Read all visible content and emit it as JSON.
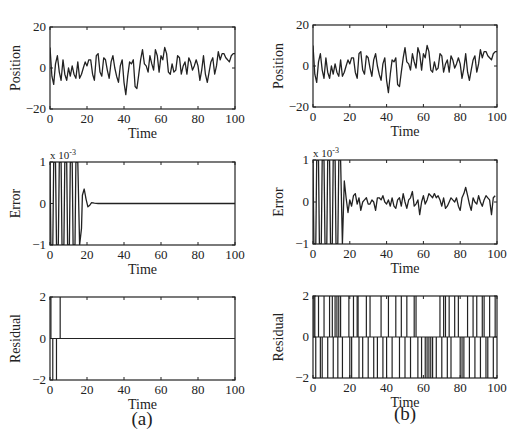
{
  "figure": {
    "captions": [
      "(a)",
      "(b)"
    ],
    "exponent_label": "x 10",
    "exponent_power": "-3"
  },
  "chart_data": [
    {
      "id": "a-position",
      "panel": "(a)",
      "type": "line",
      "title": "",
      "xlabel": "Time",
      "ylabel": "Position",
      "xlim": [
        0,
        100
      ],
      "ylim": [
        -20,
        20
      ],
      "xticks": [
        0,
        20,
        40,
        60,
        80,
        100
      ],
      "yticks": [
        -20,
        0,
        20
      ],
      "x": [
        0,
        1,
        2,
        3,
        4,
        5,
        6,
        7,
        8,
        9,
        10,
        11,
        12,
        13,
        14,
        15,
        16,
        17,
        18,
        19,
        20,
        21,
        22,
        23,
        24,
        25,
        26,
        27,
        28,
        29,
        30,
        31,
        32,
        33,
        34,
        35,
        36,
        37,
        38,
        39,
        40,
        41,
        42,
        43,
        44,
        45,
        46,
        47,
        48,
        49,
        50,
        51,
        52,
        53,
        54,
        55,
        56,
        57,
        58,
        59,
        60,
        61,
        62,
        63,
        64,
        65,
        66,
        67,
        68,
        69,
        70,
        71,
        72,
        73,
        74,
        75,
        76,
        77,
        78,
        79,
        80,
        81,
        82,
        83,
        84,
        85,
        86,
        87,
        88,
        89,
        90,
        91,
        92,
        93,
        94,
        95,
        96,
        97,
        98,
        99,
        100
      ],
      "values": [
        10,
        -4,
        -8,
        2,
        6,
        -2,
        -6,
        4,
        -3,
        -6,
        0,
        -4,
        1,
        -3,
        -5,
        3,
        -5,
        -3,
        0,
        3,
        1,
        4,
        4,
        -3,
        -6,
        6,
        7,
        -2,
        -4,
        5,
        4,
        -1,
        -5,
        3,
        6,
        0,
        -4,
        -7,
        1,
        4,
        -7,
        -13,
        -4,
        3,
        2,
        4,
        -9,
        -10,
        -3,
        4,
        9,
        2,
        1,
        -2,
        6,
        2,
        -1,
        9,
        6,
        -2,
        6,
        4,
        10,
        7,
        -2,
        -3,
        2,
        -2,
        -1,
        6,
        5,
        -3,
        1,
        3,
        -3,
        5,
        3,
        -1,
        1,
        4,
        1,
        -6,
        -1,
        6,
        -3,
        -7,
        -2,
        3,
        5,
        -3,
        1,
        8,
        4,
        7,
        7,
        5,
        4,
        3,
        6,
        7,
        7
      ]
    },
    {
      "id": "b-position",
      "panel": "(b)",
      "type": "line",
      "title": "",
      "xlabel": "Time",
      "ylabel": "Position",
      "xlim": [
        0,
        100
      ],
      "ylim": [
        -20,
        20
      ],
      "xticks": [
        0,
        20,
        40,
        60,
        80,
        100
      ],
      "yticks": [
        -20,
        0,
        20
      ],
      "x": [
        0,
        1,
        2,
        3,
        4,
        5,
        6,
        7,
        8,
        9,
        10,
        11,
        12,
        13,
        14,
        15,
        16,
        17,
        18,
        19,
        20,
        21,
        22,
        23,
        24,
        25,
        26,
        27,
        28,
        29,
        30,
        31,
        32,
        33,
        34,
        35,
        36,
        37,
        38,
        39,
        40,
        41,
        42,
        43,
        44,
        45,
        46,
        47,
        48,
        49,
        50,
        51,
        52,
        53,
        54,
        55,
        56,
        57,
        58,
        59,
        60,
        61,
        62,
        63,
        64,
        65,
        66,
        67,
        68,
        69,
        70,
        71,
        72,
        73,
        74,
        75,
        76,
        77,
        78,
        79,
        80,
        81,
        82,
        83,
        84,
        85,
        86,
        87,
        88,
        89,
        90,
        91,
        92,
        93,
        94,
        95,
        96,
        97,
        98,
        99,
        100
      ],
      "values": [
        10,
        -4,
        -8,
        2,
        6,
        -2,
        -6,
        4,
        -3,
        -6,
        0,
        -4,
        1,
        -3,
        -5,
        3,
        -5,
        -3,
        0,
        3,
        1,
        4,
        4,
        -3,
        -6,
        6,
        7,
        -2,
        -4,
        5,
        4,
        -1,
        -5,
        3,
        6,
        0,
        -4,
        -7,
        1,
        4,
        -7,
        -13,
        -4,
        3,
        2,
        4,
        -9,
        -10,
        -3,
        4,
        9,
        2,
        1,
        -2,
        6,
        2,
        -1,
        9,
        6,
        -2,
        6,
        4,
        10,
        7,
        -2,
        -3,
        2,
        -2,
        -1,
        6,
        5,
        -3,
        1,
        3,
        -3,
        5,
        3,
        -1,
        1,
        4,
        1,
        -6,
        -1,
        6,
        -3,
        -7,
        -2,
        3,
        5,
        -3,
        1,
        8,
        4,
        7,
        7,
        5,
        4,
        3,
        6,
        7,
        7
      ]
    },
    {
      "id": "a-error",
      "panel": "(a)",
      "type": "line",
      "title": "",
      "xlabel": "Time",
      "ylabel": "Error",
      "yscale_note": "x 10^-3",
      "xlim": [
        0,
        100
      ],
      "ylim": [
        -1,
        1
      ],
      "xticks": [
        0,
        20,
        40,
        60,
        80,
        100
      ],
      "yticks": [
        -1,
        0,
        1
      ],
      "x": [
        0,
        0.5,
        1.5,
        2,
        3,
        3.5,
        4.5,
        5,
        6,
        6.5,
        7.5,
        8,
        9,
        9.5,
        10.5,
        11,
        12,
        12.5,
        13.5,
        14,
        15,
        16,
        17,
        17.5,
        18.5,
        19.5,
        20.5,
        21.5,
        22.5,
        24,
        26,
        30,
        40,
        60,
        80,
        100
      ],
      "values": [
        1,
        -1,
        -1,
        1,
        1,
        -1,
        -1,
        1,
        1,
        -1,
        -1,
        1,
        1,
        -1,
        -1,
        1,
        1,
        -1,
        -1,
        1,
        1,
        -1,
        -0.6,
        0.2,
        0.35,
        0.1,
        -0.08,
        -0.04,
        0.02,
        0.01,
        0,
        0,
        0,
        0,
        0,
        0
      ]
    },
    {
      "id": "b-error",
      "panel": "(b)",
      "type": "line",
      "title": "",
      "xlabel": "Time",
      "ylabel": "Error",
      "yscale_note": "x 10^-3",
      "xlim": [
        0,
        100
      ],
      "ylim": [
        -1,
        1
      ],
      "xticks": [
        0,
        20,
        40,
        60,
        80,
        100
      ],
      "yticks": [
        -1,
        0,
        1
      ],
      "x": [
        0,
        0.5,
        1.5,
        2,
        3,
        3.5,
        4.5,
        5,
        6,
        6.5,
        7.5,
        8,
        9,
        9.5,
        10.5,
        11,
        12,
        12.5,
        13.5,
        14,
        15,
        16,
        17,
        18,
        19,
        20,
        21,
        22,
        23,
        24,
        25,
        26,
        27,
        28,
        29,
        30,
        31,
        32,
        33,
        34,
        35,
        36,
        37,
        38,
        39,
        40,
        41,
        42,
        43,
        44,
        45,
        46,
        47,
        48,
        49,
        50,
        51,
        52,
        53,
        54,
        55,
        56,
        57,
        58,
        59,
        60,
        61,
        62,
        63,
        64,
        65,
        66,
        67,
        68,
        69,
        70,
        71,
        72,
        73,
        74,
        75,
        76,
        77,
        78,
        79,
        80,
        81,
        82,
        83,
        84,
        85,
        86,
        87,
        88,
        89,
        90,
        91,
        92,
        93,
        94,
        95,
        96,
        97,
        98,
        99,
        100
      ],
      "values": [
        1,
        -1,
        -1,
        1,
        1,
        -1,
        -1,
        1,
        1,
        -1,
        -1,
        1,
        1,
        -1,
        -1,
        1,
        1,
        -1,
        -1,
        1,
        1,
        -1,
        0.5,
        0.1,
        -0.25,
        0.05,
        -0.1,
        0.15,
        0.2,
        -0.05,
        0.1,
        -0.2,
        0,
        0.05,
        0.1,
        -0.05,
        -0.05,
        0.05,
        0,
        -0.2,
        0.1,
        0.1,
        0.05,
        0.15,
        0,
        -0.05,
        0.05,
        -0.1,
        0.1,
        -0.1,
        -0.15,
        0.05,
        0.1,
        -0.1,
        0.2,
        0,
        -0.15,
        0.05,
        0.1,
        0.25,
        -0.1,
        -0.05,
        0.05,
        -0.3,
        0,
        0.15,
        -0.05,
        0.05,
        0.2,
        0.15,
        0.1,
        0.2,
        0.1,
        0.15,
        0.05,
        -0.1,
        0.1,
        -0.15,
        -0.1,
        0,
        0.1,
        0.05,
        0,
        0.1,
        -0.1,
        -0.2,
        0.1,
        0.2,
        0.35,
        0.15,
        -0.05,
        -0.2,
        0.1,
        0,
        -0.05,
        0.15,
        0,
        -0.1,
        0.05,
        0.15,
        0.1,
        0.05,
        -0.3,
        0.1,
        0.15
      ]
    },
    {
      "id": "a-residual",
      "panel": "(a)",
      "type": "line",
      "title": "",
      "xlabel": "Time",
      "ylabel": "Residual",
      "xlim": [
        0,
        100
      ],
      "ylim": [
        -2,
        2
      ],
      "xticks": [
        0,
        20,
        40,
        60,
        80,
        100
      ],
      "yticks": [
        -2,
        0,
        2
      ],
      "spikes": [
        {
          "x": 0.5,
          "y": 2
        },
        {
          "x": 1.5,
          "y": -2
        },
        {
          "x": 3.5,
          "y": -2
        },
        {
          "x": 5.5,
          "y": 2
        }
      ],
      "baseline": 0
    },
    {
      "id": "b-residual",
      "panel": "(b)",
      "type": "line",
      "title": "",
      "xlabel": "Time",
      "ylabel": "Residual",
      "xlim": [
        0,
        100
      ],
      "ylim": [
        -2,
        2
      ],
      "xticks": [
        0,
        20,
        40,
        60,
        80,
        100
      ],
      "yticks": [
        -2,
        0,
        2
      ],
      "spikes": [
        {
          "x": 0.5,
          "y": 2
        },
        {
          "x": 1,
          "y": 2
        },
        {
          "x": 1.5,
          "y": -2
        },
        {
          "x": 3,
          "y": 2
        },
        {
          "x": 4,
          "y": -2
        },
        {
          "x": 5,
          "y": -2
        },
        {
          "x": 6,
          "y": 2
        },
        {
          "x": 8,
          "y": -2
        },
        {
          "x": 9,
          "y": 2
        },
        {
          "x": 10.5,
          "y": 2
        },
        {
          "x": 11,
          "y": -2
        },
        {
          "x": 12,
          "y": 2
        },
        {
          "x": 13,
          "y": 2
        },
        {
          "x": 13.5,
          "y": -2
        },
        {
          "x": 14,
          "y": 2
        },
        {
          "x": 15,
          "y": 2
        },
        {
          "x": 16,
          "y": -2
        },
        {
          "x": 19.5,
          "y": 2
        },
        {
          "x": 20,
          "y": -2
        },
        {
          "x": 21,
          "y": -2
        },
        {
          "x": 22,
          "y": 2
        },
        {
          "x": 24,
          "y": 2
        },
        {
          "x": 24.5,
          "y": 2
        },
        {
          "x": 25,
          "y": -2
        },
        {
          "x": 27,
          "y": -2
        },
        {
          "x": 29,
          "y": 2
        },
        {
          "x": 30,
          "y": -2
        },
        {
          "x": 31,
          "y": 2
        },
        {
          "x": 33,
          "y": -2
        },
        {
          "x": 35,
          "y": -2
        },
        {
          "x": 37,
          "y": 2
        },
        {
          "x": 38,
          "y": -2
        },
        {
          "x": 40,
          "y": -2
        },
        {
          "x": 41,
          "y": 2
        },
        {
          "x": 43,
          "y": -2
        },
        {
          "x": 45,
          "y": 2
        },
        {
          "x": 47,
          "y": -2
        },
        {
          "x": 48,
          "y": 2
        },
        {
          "x": 50,
          "y": -2
        },
        {
          "x": 51,
          "y": 2
        },
        {
          "x": 53,
          "y": -2
        },
        {
          "x": 55,
          "y": 2
        },
        {
          "x": 56,
          "y": 2
        },
        {
          "x": 57,
          "y": -2
        },
        {
          "x": 59,
          "y": -2
        },
        {
          "x": 61,
          "y": -2
        },
        {
          "x": 62,
          "y": -2
        },
        {
          "x": 63,
          "y": -2
        },
        {
          "x": 64,
          "y": -2
        },
        {
          "x": 65,
          "y": -2
        },
        {
          "x": 67,
          "y": -2
        },
        {
          "x": 69,
          "y": 2
        },
        {
          "x": 70,
          "y": -2
        },
        {
          "x": 71,
          "y": 2
        },
        {
          "x": 72,
          "y": 2
        },
        {
          "x": 73,
          "y": -2
        },
        {
          "x": 74,
          "y": 2
        },
        {
          "x": 75,
          "y": -2
        },
        {
          "x": 77,
          "y": 2
        },
        {
          "x": 79,
          "y": 2
        },
        {
          "x": 80,
          "y": -2
        },
        {
          "x": 81,
          "y": -2
        },
        {
          "x": 82,
          "y": -2
        },
        {
          "x": 84,
          "y": 2
        },
        {
          "x": 85,
          "y": -2
        },
        {
          "x": 87,
          "y": 2
        },
        {
          "x": 88,
          "y": -2
        },
        {
          "x": 89,
          "y": 2
        },
        {
          "x": 91,
          "y": -2
        },
        {
          "x": 92,
          "y": 2
        },
        {
          "x": 93,
          "y": 2
        },
        {
          "x": 94,
          "y": -2
        },
        {
          "x": 95,
          "y": -2
        },
        {
          "x": 96,
          "y": 2
        },
        {
          "x": 98,
          "y": -2
        },
        {
          "x": 99,
          "y": 2
        }
      ],
      "baseline": 0
    }
  ]
}
